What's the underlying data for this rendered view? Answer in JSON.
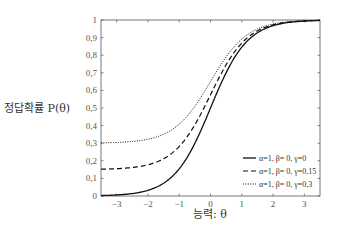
{
  "chart_data": {
    "type": "line",
    "title": "",
    "xlabel": "능력: θ",
    "ylabel": "정답확률 P(θ)",
    "xlim": [
      -3.5,
      3.5
    ],
    "ylim": [
      0,
      1
    ],
    "xticks": [
      -3,
      -2,
      -1,
      0,
      1,
      2,
      3
    ],
    "xtick_labels": [
      "−3",
      "−2",
      "−1",
      "0",
      "1",
      "2",
      "3"
    ],
    "yticks": [
      0,
      0.1,
      0.2,
      0.3,
      0.4,
      0.5,
      0.6,
      0.7,
      0.8,
      0.9,
      1
    ],
    "ytick_labels": [
      "0",
      "0.1",
      "0.2",
      "0.3",
      "0.4",
      "0.5",
      "0.6",
      "0.7",
      "0.8",
      "0.9",
      "1"
    ],
    "grid": false,
    "legend_position": "lower right",
    "model": "P(θ) = γ + (1−γ) / (1 + exp(−1.7·α·(θ−β)))",
    "series": [
      {
        "name": "α=1,  β= 0, γ=0",
        "a": 1,
        "b": 0,
        "c": 0,
        "style": "solid",
        "x": [
          -3.5,
          -3,
          -2,
          -1,
          0,
          1,
          2,
          3,
          3.5
        ],
        "values": [
          0.003,
          0.006,
          0.032,
          0.154,
          0.5,
          0.846,
          0.968,
          0.994,
          0.997
        ]
      },
      {
        "name": "α=1,  β= 0, γ=0.15",
        "a": 1,
        "b": 0,
        "c": 0.15,
        "style": "dashed",
        "x": [
          -3.5,
          -3,
          -2,
          -1,
          0,
          1,
          2,
          3,
          3.5
        ],
        "values": [
          0.152,
          0.155,
          0.177,
          0.281,
          0.575,
          0.869,
          0.973,
          0.995,
          0.998
        ]
      },
      {
        "name": "α=1,  β= 0, γ=0.3",
        "a": 1,
        "b": 0,
        "c": 0.3,
        "style": "dotted",
        "x": [
          -3.5,
          -3,
          -2,
          -1,
          0,
          1,
          2,
          3,
          3.5
        ],
        "values": [
          0.302,
          0.304,
          0.322,
          0.408,
          0.65,
          0.892,
          0.978,
          0.996,
          0.998
        ]
      }
    ]
  },
  "labels": {
    "ylabel": "정답확률 P(θ)",
    "xlabel": "능력: θ"
  }
}
